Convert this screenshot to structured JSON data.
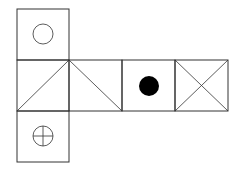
{
  "diagram": {
    "line_color": "#333333",
    "fill_color": "#000000",
    "background": "#ffffff",
    "faces": [
      {
        "id": "top",
        "symbol": "empty-circle"
      },
      {
        "id": "middle-1",
        "symbol": "diagonal-bottom-left-to-top-right"
      },
      {
        "id": "middle-2",
        "symbol": "diagonal-top-left-to-bottom-right"
      },
      {
        "id": "middle-3",
        "symbol": "filled-circle"
      },
      {
        "id": "middle-4",
        "symbol": "x-cross"
      },
      {
        "id": "bottom",
        "symbol": "circle-with-plus"
      }
    ]
  }
}
